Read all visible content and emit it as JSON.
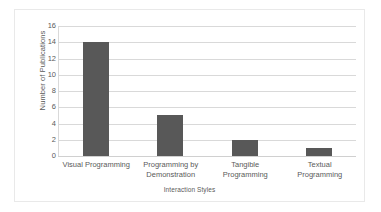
{
  "chart_data": {
    "type": "bar",
    "title": "",
    "xlabel": "Interaction Styles",
    "ylabel": "Number of Publications",
    "categories": [
      "Visual Programming",
      "Programming by Demonstration",
      "Tangible Programming",
      "Textual Programming"
    ],
    "values": [
      14,
      5,
      2,
      1
    ],
    "ylim": [
      0,
      16
    ],
    "yticks": [
      0,
      2,
      4,
      6,
      8,
      10,
      12,
      14,
      16
    ],
    "ytick_labels": [
      "0",
      "2",
      "4",
      "6",
      "8",
      "10",
      "12",
      "14",
      "16"
    ],
    "grid": true,
    "legend": false,
    "bar_color": "#585858",
    "gridline_color": "#d9d9d9",
    "text_color": "#5a5a5a",
    "border_color": "#e9e9e9"
  }
}
